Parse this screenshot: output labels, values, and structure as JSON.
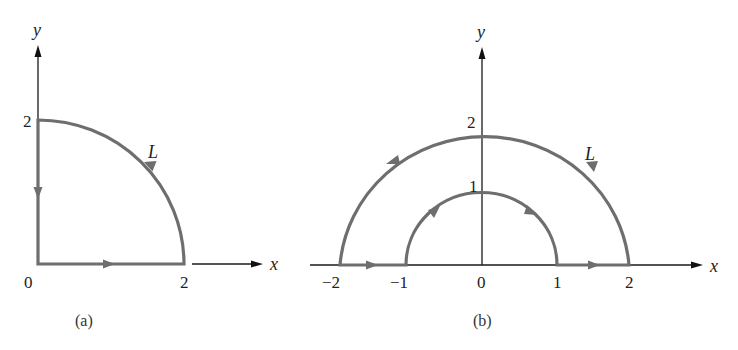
{
  "figure_a": {
    "caption": "(a)",
    "axis_x_label": "x",
    "axis_y_label": "y",
    "origin_label": "0",
    "x_tick_label": "2",
    "y_tick_label": "2",
    "contour_label": "L",
    "description": "Quarter circle of radius 2 in first quadrant: from (0,0) along x-axis to (2,0), counterclockwise along arc to (0,2), then down y-axis back to (0,0)."
  },
  "figure_b": {
    "caption": "(b)",
    "axis_x_label": "x",
    "axis_y_label": "y",
    "x_tick_labels": [
      "−2",
      "−1",
      "0",
      "1",
      "2"
    ],
    "y_tick_labels": [
      "1",
      "2"
    ],
    "contour_label": "L",
    "description": "Half annulus in upper half-plane between radii 1 and 2: from (-2,0) to (-1,0), clockwise along inner arc to (1,0), to (2,0), counterclockwise along outer arc back to (-2,0)."
  },
  "colors": {
    "contour": "#6e6e6e",
    "axis": "#1a1a1a",
    "background": "#ffffff"
  }
}
